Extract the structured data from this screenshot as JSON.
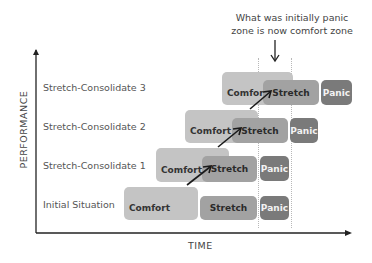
{
  "annotation": {
    "line1": "What was initially panic",
    "line2": "zone is now comfort zone"
  },
  "axes": {
    "y_label": "PERFORMANCE",
    "x_label": "TIME"
  },
  "rows": [
    {
      "label": "Stretch-Consolidate 3",
      "comfort": "Comfort",
      "stretch": "Stretch",
      "panic": "Panic"
    },
    {
      "label": "Stretch-Consolidate 2",
      "comfort": "Comfort",
      "stretch": "Stretch",
      "panic": "Panic"
    },
    {
      "label": "Stretch-Consolidate 1",
      "comfort": "Comfort",
      "stretch": "Stretch",
      "panic": "Panic"
    },
    {
      "label": "Initial Situation",
      "comfort": "Comfort",
      "stretch": "Stretch",
      "panic": "Panic"
    }
  ],
  "colors": {
    "comfort": "#c4c4c4",
    "stretch": "#a2a2a2",
    "panic": "#7a7a7a"
  }
}
